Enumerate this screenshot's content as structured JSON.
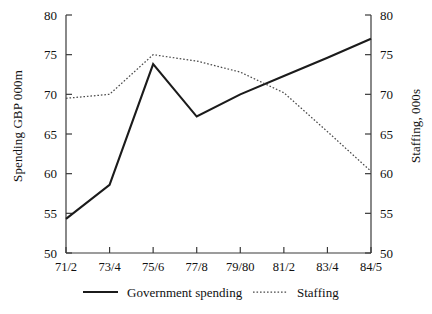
{
  "chart_data": {
    "type": "line",
    "title": "",
    "xlabel": "",
    "ylabel": "Spending GBP 000m",
    "ylabel_right": "Staffing, 000s",
    "categories": [
      "71/2",
      "73/4",
      "75/6",
      "77/8",
      "79/80",
      "81/2",
      "83/4",
      "84/5"
    ],
    "ylim": [
      50,
      80
    ],
    "ylim_right": [
      50,
      80
    ],
    "yticks": [
      50,
      55,
      60,
      65,
      70,
      75,
      80
    ],
    "yticks_right": [
      50,
      55,
      60,
      65,
      70,
      75,
      80
    ],
    "grid": false,
    "legend_position": "bottom",
    "series": [
      {
        "name": "Government spending",
        "axis": "left",
        "style": "solid",
        "color": "#1b1b1b",
        "values": [
          54.3,
          58.6,
          73.8,
          67.2,
          70.0,
          72.3,
          74.6,
          77.0
        ]
      },
      {
        "name": "Staffing",
        "axis": "right",
        "style": "dotted",
        "color": "#4a4a4a",
        "values": [
          69.5,
          70.0,
          75.0,
          74.2,
          72.8,
          70.2,
          65.3,
          60.3
        ]
      }
    ]
  },
  "axes": {
    "left_title": "Spending GBP 000m",
    "right_title": "Staffing, 000s",
    "tick_labels": [
      "80",
      "75",
      "70",
      "65",
      "60",
      "55",
      "50"
    ],
    "category_labels": [
      "71/2",
      "73/4",
      "75/6",
      "77/8",
      "79/80",
      "81/2",
      "83/4",
      "84/5"
    ]
  },
  "legend": {
    "items": [
      {
        "label": "Government spending",
        "style": "solid"
      },
      {
        "label": "Staffing",
        "style": "dotted"
      }
    ]
  }
}
